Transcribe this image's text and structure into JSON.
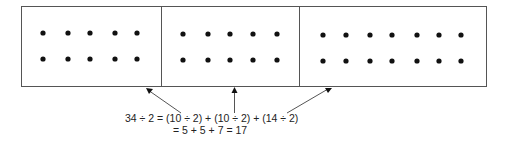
{
  "diagram": {
    "groups": [
      {
        "label": "group-1",
        "rows": 2,
        "cols": 5,
        "count": 10
      },
      {
        "label": "group-2",
        "rows": 2,
        "cols": 5,
        "count": 10
      },
      {
        "label": "group-3",
        "rows": 2,
        "cols": 7,
        "count": 14
      }
    ],
    "equation": {
      "line1": "34 ÷ 2 = (10 ÷ 2) + (10 ÷ 2) + (14 ÷ 2)",
      "line2": "= 5 + 5 + 7 = 17"
    },
    "colors": {
      "line": "#555555",
      "dot": "#111111"
    }
  }
}
